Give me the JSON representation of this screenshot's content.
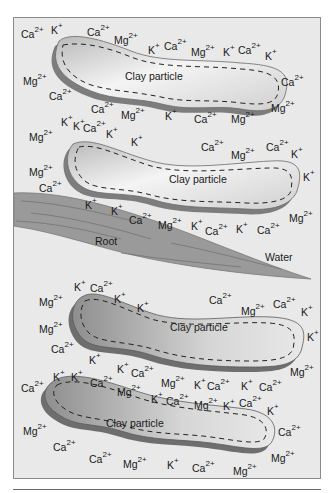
{
  "labels": {
    "clay_1": "Clay particle",
    "clay_2": "Clay particle",
    "clay_3": "Clay particle",
    "clay_4": "Clay particle",
    "root": "Root",
    "water": "Water"
  },
  "ion_types": {
    "calcium": {
      "symbol": "Ca",
      "charge": "2+"
    },
    "magnesium": {
      "symbol": "Mg",
      "charge": "2+"
    },
    "potassium": {
      "symbol": "K",
      "charge": "+"
    }
  },
  "colors": {
    "background": "#e9e9e9",
    "clay_fill_light": "#f3f3f3",
    "clay_fill_dark": "#a9a9a9",
    "clay_shadow": "#7d7d7d",
    "root_fill": "#9a9a9a",
    "root_lines": "#6e6e6e",
    "frame_border": "#8a8a8a"
  },
  "ions": [
    {
      "s": "Ca",
      "c": "2+",
      "x": 20,
      "y": 22
    },
    {
      "s": "K",
      "c": "+",
      "x": 50,
      "y": 18
    },
    {
      "s": "Ca",
      "c": "2+",
      "x": 86,
      "y": 20
    },
    {
      "s": "Mg",
      "c": "2+",
      "x": 113,
      "y": 28
    },
    {
      "s": "K",
      "c": "+",
      "x": 147,
      "y": 38
    },
    {
      "s": "Ca",
      "c": "2+",
      "x": 163,
      "y": 34
    },
    {
      "s": "Mg",
      "c": "2+",
      "x": 190,
      "y": 40
    },
    {
      "s": "K",
      "c": "+",
      "x": 222,
      "y": 40
    },
    {
      "s": "Ca",
      "c": "2+",
      "x": 237,
      "y": 38
    },
    {
      "s": "K",
      "c": "+",
      "x": 264,
      "y": 44
    },
    {
      "s": "Mg",
      "c": "2+",
      "x": 22,
      "y": 69
    },
    {
      "s": "Ca",
      "c": "2+",
      "x": 280,
      "y": 70
    },
    {
      "s": "Ca",
      "c": "2+",
      "x": 48,
      "y": 84
    },
    {
      "s": "Ca",
      "c": "2+",
      "x": 90,
      "y": 97
    },
    {
      "s": "Mg",
      "c": "2+",
      "x": 120,
      "y": 103
    },
    {
      "s": "K",
      "c": "+",
      "x": 164,
      "y": 104
    },
    {
      "s": "Ca",
      "c": "2+",
      "x": 193,
      "y": 107
    },
    {
      "s": "Mg",
      "c": "2+",
      "x": 230,
      "y": 107
    },
    {
      "s": "Mg",
      "c": "2+",
      "x": 270,
      "y": 96
    },
    {
      "s": "K",
      "c": "+",
      "x": 60,
      "y": 110
    },
    {
      "s": "Mg",
      "c": "2+",
      "x": 28,
      "y": 125
    },
    {
      "s": "K",
      "c": "+",
      "x": 72,
      "y": 114
    },
    {
      "s": "Ca",
      "c": "2+",
      "x": 82,
      "y": 116
    },
    {
      "s": "K",
      "c": "+",
      "x": 105,
      "y": 122
    },
    {
      "s": "K",
      "c": "+",
      "x": 130,
      "y": 130
    },
    {
      "s": "Ca",
      "c": "2+",
      "x": 200,
      "y": 135
    },
    {
      "s": "Mg",
      "c": "2+",
      "x": 230,
      "y": 143
    },
    {
      "s": "Ca",
      "c": "2+",
      "x": 265,
      "y": 135
    },
    {
      "s": "K",
      "c": "+",
      "x": 290,
      "y": 142
    },
    {
      "s": "Mg",
      "c": "2+",
      "x": 28,
      "y": 160
    },
    {
      "s": "K",
      "c": "+",
      "x": 302,
      "y": 165
    },
    {
      "s": "Ca",
      "c": "2+",
      "x": 38,
      "y": 176
    },
    {
      "s": "K",
      "c": "+",
      "x": 84,
      "y": 193
    },
    {
      "s": "K",
      "c": "+",
      "x": 110,
      "y": 199
    },
    {
      "s": "Ca",
      "c": "2+",
      "x": 128,
      "y": 208
    },
    {
      "s": "Mg",
      "c": "2+",
      "x": 157,
      "y": 213
    },
    {
      "s": "K",
      "c": "+",
      "x": 190,
      "y": 214
    },
    {
      "s": "Ca",
      "c": "2+",
      "x": 204,
      "y": 219
    },
    {
      "s": "K",
      "c": "+",
      "x": 235,
      "y": 217
    },
    {
      "s": "Ca",
      "c": "2+",
      "x": 256,
      "y": 218
    },
    {
      "s": "Mg",
      "c": "2+",
      "x": 288,
      "y": 206
    },
    {
      "s": "K",
      "c": "+",
      "x": 73,
      "y": 275
    },
    {
      "s": "Ca",
      "c": "2+",
      "x": 89,
      "y": 276
    },
    {
      "s": "Mg",
      "c": "2+",
      "x": 38,
      "y": 290
    },
    {
      "s": "K",
      "c": "+",
      "x": 113,
      "y": 287
    },
    {
      "s": "K",
      "c": "+",
      "x": 136,
      "y": 296
    },
    {
      "s": "Ca",
      "c": "2+",
      "x": 208,
      "y": 288
    },
    {
      "s": "Mg",
      "c": "2+",
      "x": 240,
      "y": 299
    },
    {
      "s": "Ca",
      "c": "2+",
      "x": 272,
      "y": 292
    },
    {
      "s": "K",
      "c": "+",
      "x": 300,
      "y": 300
    },
    {
      "s": "Mg",
      "c": "2+",
      "x": 38,
      "y": 317
    },
    {
      "s": "K",
      "c": "+",
      "x": 306,
      "y": 325
    },
    {
      "s": "Ca",
      "c": "2+",
      "x": 50,
      "y": 337
    },
    {
      "s": "K",
      "c": "+",
      "x": 88,
      "y": 348
    },
    {
      "s": "K",
      "c": "+",
      "x": 116,
      "y": 357
    },
    {
      "s": "Mg",
      "c": "2+",
      "x": 289,
      "y": 360
    },
    {
      "s": "K",
      "c": "+",
      "x": 52,
      "y": 365
    },
    {
      "s": "K",
      "c": "+",
      "x": 70,
      "y": 365
    },
    {
      "s": "Ca",
      "c": "2+",
      "x": 130,
      "y": 361
    },
    {
      "s": "Ca",
      "c": "2+",
      "x": 89,
      "y": 371
    },
    {
      "s": "Mg",
      "c": "2+",
      "x": 160,
      "y": 371
    },
    {
      "s": "K",
      "c": "+",
      "x": 193,
      "y": 373
    },
    {
      "s": "Ca",
      "c": "2+",
      "x": 206,
      "y": 374
    },
    {
      "s": "K",
      "c": "+",
      "x": 240,
      "y": 374
    },
    {
      "s": "Ca",
      "c": "2+",
      "x": 258,
      "y": 375
    },
    {
      "s": "Ca",
      "c": "2+",
      "x": 20,
      "y": 376
    },
    {
      "s": "Mg",
      "c": "2+",
      "x": 116,
      "y": 380
    },
    {
      "s": "K",
      "c": "+",
      "x": 150,
      "y": 387
    },
    {
      "s": "Ca",
      "c": "2+",
      "x": 165,
      "y": 389
    },
    {
      "s": "Mg",
      "c": "2+",
      "x": 193,
      "y": 393
    },
    {
      "s": "K",
      "c": "+",
      "x": 222,
      "y": 394
    },
    {
      "s": "Ca",
      "c": "2+",
      "x": 238,
      "y": 391
    },
    {
      "s": "K",
      "c": "+",
      "x": 266,
      "y": 399
    },
    {
      "s": "Mg",
      "c": "2+",
      "x": 22,
      "y": 419
    },
    {
      "s": "Ca",
      "c": "2+",
      "x": 277,
      "y": 420
    },
    {
      "s": "Ca",
      "c": "2+",
      "x": 52,
      "y": 435
    },
    {
      "s": "Ca",
      "c": "2+",
      "x": 88,
      "y": 447
    },
    {
      "s": "Mg",
      "c": "2+",
      "x": 122,
      "y": 452
    },
    {
      "s": "K",
      "c": "+",
      "x": 166,
      "y": 453
    },
    {
      "s": "Ca",
      "c": "2+",
      "x": 191,
      "y": 456
    },
    {
      "s": "Mg",
      "c": "2+",
      "x": 232,
      "y": 459
    },
    {
      "s": "Mg",
      "c": "2+",
      "x": 270,
      "y": 446
    }
  ]
}
